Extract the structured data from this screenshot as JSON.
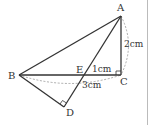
{
  "figure": {
    "points": {
      "A": "A",
      "B": "B",
      "C": "C",
      "D": "D",
      "E": "E"
    },
    "measurements": {
      "AC": "2cm",
      "EC": "1cm",
      "BE_arc": "3cm"
    },
    "segments": [
      "AB",
      "AD",
      "AC",
      "BC",
      "BD"
    ],
    "right_angles": [
      "C",
      "D"
    ],
    "dashed_arcs": [
      "AC",
      "BC"
    ],
    "colors": {
      "line": "#333333",
      "dashed": "#888888",
      "border": "#bbbbbb"
    }
  }
}
